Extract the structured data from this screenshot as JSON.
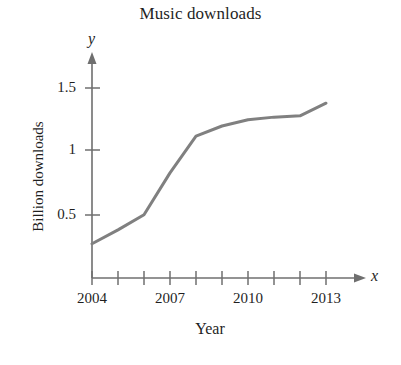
{
  "chart_data": {
    "type": "line",
    "title": "Music downloads",
    "xlabel": "Year",
    "ylabel": "Billion downloads",
    "x_axis_variable": "x",
    "y_axis_variable": "y",
    "grid": false,
    "legend": null,
    "xlim": [
      2004,
      2013.7
    ],
    "ylim": [
      0,
      1.62
    ],
    "x_tick_labels": [
      "2004",
      "2007",
      "2010",
      "2013"
    ],
    "x_tick_label_values": [
      2004,
      2007,
      2010,
      2013
    ],
    "x_tick_values": [
      2004,
      2005,
      2006,
      2007,
      2008,
      2009,
      2010,
      2011,
      2012,
      2013
    ],
    "y_tick_labels": [
      "0.5",
      "1",
      "1.5"
    ],
    "y_tick_values": [
      0.5,
      1,
      1.5
    ],
    "series": [
      {
        "name": "Music downloads",
        "color": "#808080",
        "x": [
          2004,
          2005,
          2006,
          2007,
          2008,
          2009,
          2010,
          2011,
          2012,
          2013
        ],
        "values": [
          0.27,
          0.38,
          0.5,
          0.83,
          1.12,
          1.2,
          1.25,
          1.27,
          1.28,
          1.38
        ]
      }
    ]
  },
  "axis": {
    "color": "#6f6f6f"
  }
}
